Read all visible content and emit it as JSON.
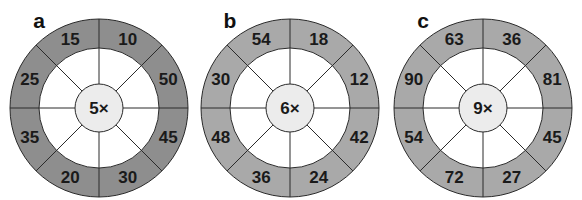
{
  "wheels": [
    {
      "label": "a",
      "multiplier": "5×",
      "ring_color": "#8e8e8e",
      "cx": 99,
      "cy": 108,
      "values_clockwise_from_top_right": [
        "10",
        "50",
        "45",
        "30",
        "20",
        "35",
        "25",
        "15"
      ]
    },
    {
      "label": "b",
      "multiplier": "6×",
      "ring_color": "#a9a9a9",
      "cx": 290,
      "cy": 108,
      "values_clockwise_from_top_right": [
        "18",
        "12",
        "42",
        "24",
        "36",
        "48",
        "30",
        "54"
      ]
    },
    {
      "label": "c",
      "multiplier": "9×",
      "ring_color": "#a9a9a9",
      "cx": 483,
      "cy": 108,
      "values_clockwise_from_top_right": [
        "36",
        "81",
        "45",
        "27",
        "72",
        "54",
        "90",
        "63"
      ]
    }
  ],
  "colors": {
    "center_fill": "#ececec",
    "inner_ring_fill": "#ffffff",
    "line": "#2a2a2a"
  }
}
